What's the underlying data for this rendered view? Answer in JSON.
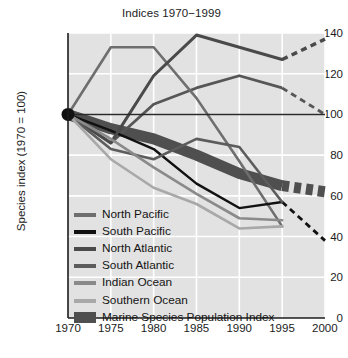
{
  "chart_data": {
    "type": "line",
    "title": "Indices 1970−1999",
    "xlabel": "",
    "ylabel": "Species index (1970 = 100)",
    "xlim": [
      1970,
      2000
    ],
    "ylim": [
      0,
      140
    ],
    "xticks": [
      1970,
      1975,
      1980,
      1985,
      1990,
      1995,
      2000
    ],
    "yticks": [
      0,
      20,
      40,
      60,
      80,
      100,
      120,
      140
    ],
    "grid": true,
    "legend_position": "inside-lower-left",
    "reference_line": 100,
    "origin_marker": {
      "x": 1970,
      "y": 100
    },
    "x": [
      1970,
      1975,
      1980,
      1985,
      1990,
      1995
    ],
    "series": [
      {
        "name": "North Pacific",
        "color": "#6e6e6e",
        "width": 2.6,
        "values": [
          100,
          133,
          133,
          108,
          77,
          45
        ],
        "dashed_extension": null
      },
      {
        "name": "South Pacific",
        "color": "#111111",
        "width": 2.4,
        "values": [
          100,
          92,
          83,
          66,
          54,
          57
        ],
        "dashed_extension": {
          "x": [
            1995,
            2000
          ],
          "values": [
            57,
            38
          ]
        }
      },
      {
        "name": "North Atlantic",
        "color": "#4a4a4a",
        "width": 3.0,
        "values": [
          100,
          86,
          119,
          139,
          133,
          127
        ],
        "dashed_extension": {
          "x": [
            1995,
            2000
          ],
          "values": [
            127,
            137
          ]
        }
      },
      {
        "name": "South Atlantic",
        "color": "#5c5c5c",
        "width": 2.6,
        "values": [
          100,
          83,
          78,
          88,
          84,
          57
        ],
        "dashed_extension": {
          "x": [
            1995,
            2000
          ],
          "values": [
            113,
            100
          ]
        }
      },
      {
        "name": "Indian Ocean",
        "color": "#8a8a8a",
        "width": 2.6,
        "values": [
          100,
          88,
          74,
          61,
          49,
          48
        ],
        "dashed_extension": null
      },
      {
        "name": "Southern Ocean",
        "color": "#a8a8a8",
        "width": 2.6,
        "values": [
          100,
          78,
          64,
          56,
          44,
          45
        ],
        "dashed_extension": null
      },
      {
        "name": "Marine Species Population Index",
        "color": "#4f4f4f",
        "width": 11,
        "kind": "band",
        "values": [
          100,
          93,
          88,
          80,
          71,
          65
        ],
        "dashed_extension": {
          "x": [
            1995,
            2000
          ],
          "values": [
            65,
            62
          ]
        }
      }
    ],
    "upper_secondary": {
      "name": "North Atlantic upper companion",
      "color": "#4a4a4a",
      "values": [
        100,
        86,
        119,
        139,
        133,
        127
      ]
    },
    "mid_line": {
      "name": "secondary rising line",
      "color": "#565656",
      "values": [
        100,
        86,
        105,
        113,
        119,
        113
      ],
      "dashed_extension": {
        "x": [
          1995,
          2000
        ],
        "values": [
          113,
          100
        ]
      }
    }
  },
  "legend": {
    "items": [
      {
        "label": "North Pacific",
        "color": "#6e6e6e",
        "type": "line"
      },
      {
        "label": "South Pacific",
        "color": "#111111",
        "type": "line"
      },
      {
        "label": "North Atlantic",
        "color": "#4a4a4a",
        "type": "line"
      },
      {
        "label": "South Atlantic",
        "color": "#5c5c5c",
        "type": "line"
      },
      {
        "label": "Indian Ocean",
        "color": "#8a8a8a",
        "type": "line"
      },
      {
        "label": "Southern Ocean",
        "color": "#a8a8a8",
        "type": "line"
      },
      {
        "label": "Marine Species Population Index",
        "color": "#4f4f4f",
        "type": "band"
      }
    ]
  },
  "axes": {
    "y_tick_labels": [
      "140",
      "120",
      "100",
      "80",
      "60",
      "40",
      "20",
      "0"
    ],
    "x_tick_labels": [
      "1970",
      "1975",
      "1980",
      "1985",
      "1990",
      "1995",
      "2000"
    ]
  }
}
